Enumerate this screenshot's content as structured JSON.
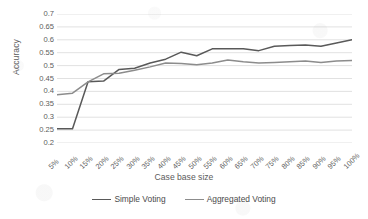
{
  "chart_data": {
    "type": "line",
    "title": "",
    "xlabel": "Case base size",
    "ylabel": "Accuracy",
    "categories": [
      "5%",
      "10%",
      "15%",
      "20%",
      "25%",
      "30%",
      "35%",
      "40%",
      "45%",
      "50%",
      "55%",
      "60%",
      "65%",
      "70%",
      "75%",
      "80%",
      "85%",
      "90%",
      "95%",
      "100%"
    ],
    "ylim": [
      0.2,
      0.7
    ],
    "ytick_labels": [
      "0.7",
      "0.65",
      "0.6",
      "0.55",
      "0.5",
      "0.45",
      "0.4",
      "0.35",
      "0.3",
      "0.25",
      "0.2"
    ],
    "ytick_values": [
      0.7,
      0.65,
      0.6,
      0.55,
      0.5,
      0.45,
      0.4,
      0.35,
      0.3,
      0.25,
      0.2
    ],
    "grid": "horizontal",
    "legend_position": "bottom",
    "series": [
      {
        "name": "Simple Voting",
        "color": "#595959",
        "values": [
          0.255,
          0.255,
          0.437,
          0.44,
          0.485,
          0.49,
          0.51,
          0.525,
          0.552,
          0.538,
          0.565,
          0.565,
          0.565,
          0.558,
          0.575,
          0.578,
          0.58,
          0.575,
          0.588,
          0.6
        ]
      },
      {
        "name": "Aggregated Voting",
        "color": "#8c8c8c",
        "values": [
          0.387,
          0.393,
          0.437,
          0.468,
          0.47,
          0.482,
          0.495,
          0.51,
          0.508,
          0.503,
          0.51,
          0.522,
          0.515,
          0.51,
          0.512,
          0.515,
          0.518,
          0.512,
          0.518,
          0.52
        ]
      }
    ]
  }
}
